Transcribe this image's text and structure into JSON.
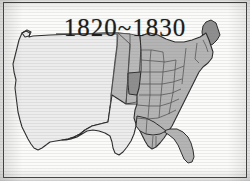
{
  "figure": {
    "title": "1820~1830",
    "width": 250,
    "height": 181
  },
  "colors": {
    "frame_border": "#3a3a3a",
    "plate_background": "#fbfbfa",
    "outline": "#2b2b2b",
    "state_border": "#4a4a4a",
    "highlighted_state_fill": "#8e8e8e",
    "existing_state_fill": "#b4b4b4",
    "territory_fill": "#b9b9b9",
    "unclaimed_fill": "#ececec",
    "title_text": "#1d1d1d"
  },
  "legend": {
    "highlighted_states": [
      "Maine",
      "Missouri"
    ],
    "fill_classes": [
      {
        "name": "highlighted",
        "label": "states admitted 1820-1830",
        "color": "#8e8e8e"
      },
      {
        "name": "existing",
        "label": "existing states",
        "color": "#b4b4b4"
      },
      {
        "name": "territory",
        "label": "organized territory",
        "color": "#b9b9b9"
      },
      {
        "name": "unclaimed",
        "label": "unorganized western land",
        "color": "#ececec"
      }
    ]
  },
  "map_regions": [
    {
      "name": "western-unclaimed",
      "fill_class": "unclaimed"
    },
    {
      "name": "northwest-territory",
      "fill_class": "territory"
    },
    {
      "name": "texas-unclaimed",
      "fill_class": "unclaimed"
    },
    {
      "name": "missouri",
      "fill_class": "highlighted"
    },
    {
      "name": "maine",
      "fill_class": "highlighted"
    },
    {
      "name": "michigan",
      "fill_class": "existing"
    },
    {
      "name": "florida",
      "fill_class": "existing"
    },
    {
      "name": "eastern-states",
      "fill_class": "existing"
    }
  ]
}
